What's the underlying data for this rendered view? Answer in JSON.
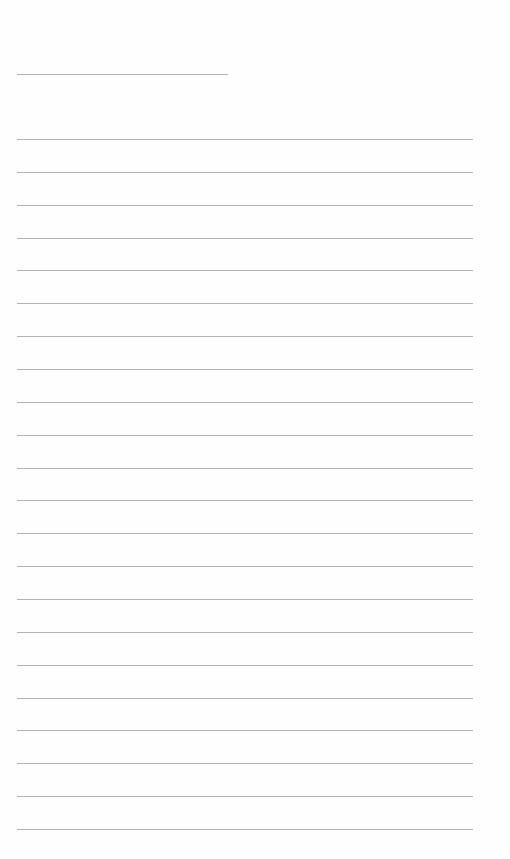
{
  "document": {
    "type": "lined-paper",
    "header_line": {
      "top": 74,
      "left": 17,
      "width": 211,
      "value": ""
    },
    "writing_lines": {
      "count": 22,
      "first_top": 139,
      "spacing": 32.86,
      "left": 17,
      "width": 456,
      "values": [
        "",
        "",
        "",
        "",
        "",
        "",
        "",
        "",
        "",
        "",
        "",
        "",
        "",
        "",
        "",
        "",
        "",
        "",
        "",
        "",
        "",
        ""
      ]
    },
    "colors": {
      "paper": "#fefefe",
      "rule": "#b3b3b3"
    }
  }
}
